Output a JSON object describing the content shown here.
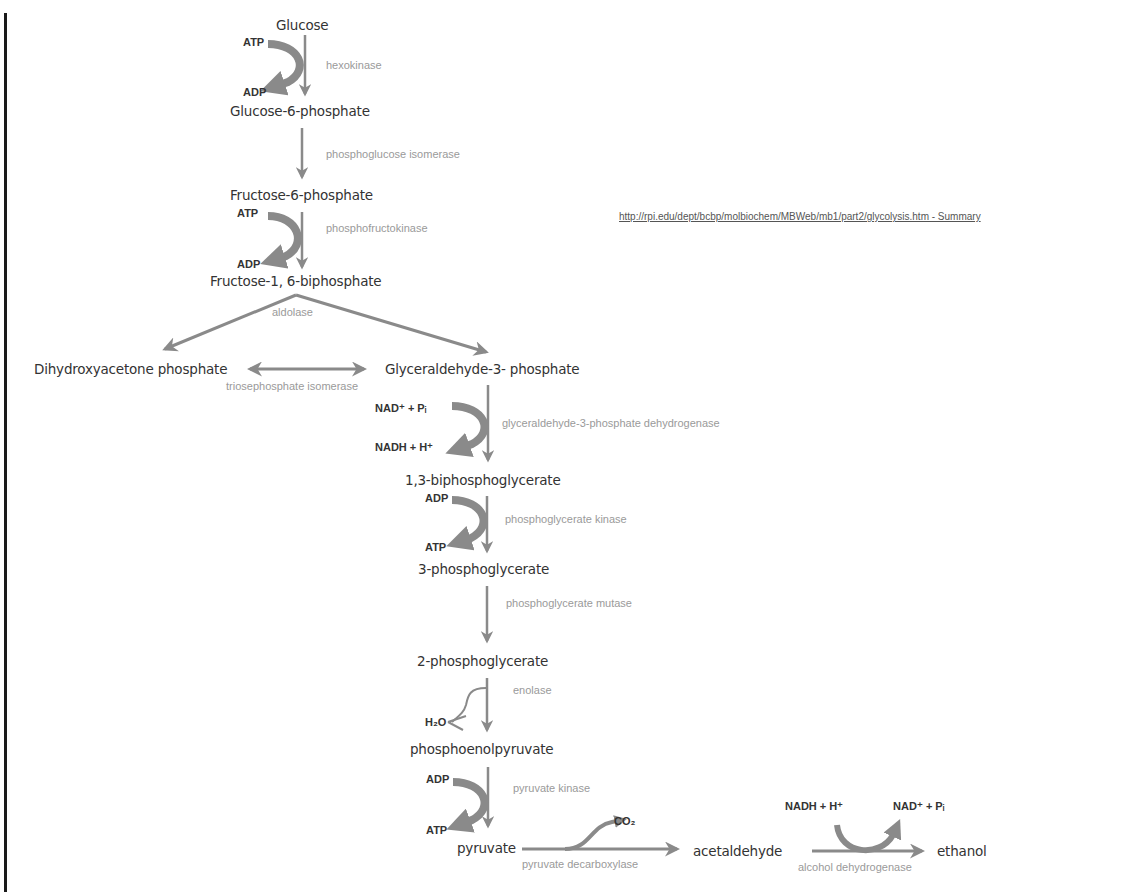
{
  "source_link": "http://rpi.edu/dept/bcbp/molbiochem/MBWeb/mb1/part2/glycolysis.htm - Summary",
  "colors": {
    "arrow": "#8a8a8a",
    "metabolite": "#333333",
    "enzyme": "#9a9a9a",
    "cofactor": "#333333"
  },
  "metabolites": {
    "glucose": "Glucose",
    "g6p": "Glucose-6-phosphate",
    "f6p": "Fructose-6-phosphate",
    "f16bp": "Fructose-1, 6-biphosphate",
    "dhap": "Dihydroxyacetone phosphate",
    "g3p": "Glyceraldehyde-3- phosphate",
    "bpg13": "1,3-biphosphoglycerate",
    "pg3": "3-phosphoglycerate",
    "pg2": "2-phosphoglycerate",
    "pep": "phosphoenolpyruvate",
    "pyruvate": "pyruvate",
    "acetaldehyde": "acetaldehyde",
    "ethanol": "ethanol"
  },
  "enzymes": {
    "hexokinase": "hexokinase",
    "pgi": "phosphoglucose isomerase",
    "pfk": "phosphofructokinase",
    "aldolase": "aldolase",
    "tpi": "triosephosphate isomerase",
    "gapdh": "glyceraldehyde-3-phosphate dehydrogenase",
    "pgk": "phosphoglycerate kinase",
    "pgm": "phosphoglycerate mutase",
    "enolase": "enolase",
    "pk": "pyruvate kinase",
    "pdc": "pyruvate decarboxylase",
    "adh": "alcohol dehydrogenase"
  },
  "cofactors": {
    "hk_in": "ATP",
    "hk_out": "ADP",
    "pfk_in": "ATP",
    "pfk_out": "ADP",
    "gapdh_in": "NAD⁺ + Pᵢ",
    "gapdh_out": "NADH + H⁺",
    "pgk_in": "ADP",
    "pgk_out": "ATP",
    "eno_out": "H₂O",
    "pk_in": "ADP",
    "pk_out": "ATP",
    "pdc_out": "CO₂",
    "adh_in": "NADH + H⁺",
    "adh_out": "NAD⁺ + Pᵢ"
  }
}
